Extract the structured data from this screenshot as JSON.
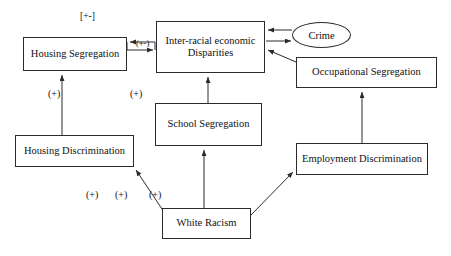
{
  "diagram": {
    "type": "causal-loop-diagram",
    "nodes": [
      {
        "id": "housing-segregation",
        "label": "Housing Segregation",
        "shape": "rectangle"
      },
      {
        "id": "interracial",
        "label": "Inter-racial economic Disparities",
        "shape": "rectangle"
      },
      {
        "id": "crime",
        "label": "Crime",
        "shape": "ellipse"
      },
      {
        "id": "occupational",
        "label": "Occupational Segregation",
        "shape": "rectangle"
      },
      {
        "id": "school-segregation",
        "label": "School Segregation",
        "shape": "rectangle"
      },
      {
        "id": "housing-discrimination",
        "label": "Housing Discrimination",
        "shape": "rectangle"
      },
      {
        "id": "employment",
        "label": "Employment Discrimination",
        "shape": "rectangle"
      },
      {
        "id": "white-racism",
        "label": "White Racism",
        "shape": "rectangle"
      }
    ],
    "node_text": {
      "housing_segregation": "Housing Segregation",
      "interracial_line1": "Inter-racial economic",
      "interracial_line2": "Disparities",
      "crime": "Crime",
      "occupational": "Occupational Segregation",
      "school_segregation": "School Segregation",
      "housing_discrimination": "Housing Discrimination",
      "employment": "Employment Discrimination",
      "white_racism": "White Racism"
    },
    "edge_labels": {
      "top_bracket": "[+-]",
      "mid_arrow": "(+-)",
      "plus_1": "(+)",
      "plus_2": "(+)",
      "plus_3": "(+)",
      "plus_4": "(+)",
      "plus_5": "(+)"
    },
    "edges": [
      {
        "from": "interracial",
        "to": "housing-segregation",
        "label": "(+-)",
        "style": "bidirectional-pair"
      },
      {
        "from": "housing-segregation",
        "to": "interracial",
        "label": "(+-)",
        "style": "bidirectional-pair"
      },
      {
        "from": "crime",
        "to": "interracial",
        "label": "",
        "style": "arrow"
      },
      {
        "from": "interracial",
        "to": "crime",
        "label": "",
        "style": "arrow"
      },
      {
        "from": "occupational",
        "to": "interracial",
        "label": "",
        "style": "arrow"
      },
      {
        "from": "school-segregation",
        "to": "interracial",
        "label": "(+)",
        "style": "arrow"
      },
      {
        "from": "housing-discrimination",
        "to": "housing-segregation",
        "label": "(+)",
        "style": "arrow"
      },
      {
        "from": "white-racism",
        "to": "school-segregation",
        "label": "(+)",
        "style": "arrow"
      },
      {
        "from": "white-racism",
        "to": "housing-discrimination",
        "label": "(+)",
        "style": "arrow"
      },
      {
        "from": "white-racism",
        "to": "employment",
        "label": "(+)",
        "style": "arrow"
      },
      {
        "from": "employment",
        "to": "occupational",
        "label": "",
        "style": "arrow"
      }
    ],
    "colors": {
      "stroke": "#2b2b2b",
      "text": "#111111",
      "background": "#ffffff"
    }
  }
}
